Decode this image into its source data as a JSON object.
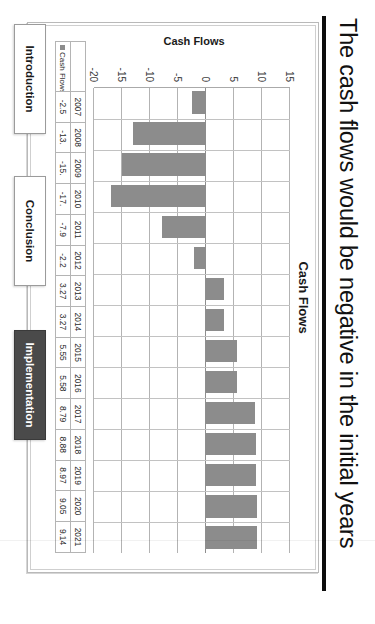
{
  "slide": {
    "title": "The cash flows would be negative in the initial years"
  },
  "chart_data": {
    "type": "bar",
    "title": "Cash Flows",
    "xlabel": "",
    "ylabel": "Cash Flows",
    "categories": [
      "2007",
      "2008",
      "2009",
      "2010",
      "2011",
      "2012",
      "2013",
      "2014",
      "2015",
      "2016",
      "2017",
      "2018",
      "2019",
      "2020",
      "2021"
    ],
    "values": [
      -2.5,
      -13.0,
      -15.0,
      -17.0,
      -7.9,
      -2.2,
      3.27,
      3.27,
      5.55,
      5.58,
      8.79,
      8.88,
      8.97,
      9.05,
      9.14
    ],
    "value_labels": [
      "-2.5",
      "-13.",
      "-15.",
      "-17.",
      "-7.9",
      "-2.2",
      "3.27",
      "3.27",
      "5.55",
      "5.58",
      "8.79",
      "8.88",
      "8.97",
      "9.05",
      "9.14"
    ],
    "ylim": [
      -20,
      15
    ],
    "yticks": [
      15,
      10,
      5,
      0,
      -5,
      -10,
      -15,
      -20
    ],
    "ytick_labels": [
      "15",
      "10",
      "5",
      "0",
      "-5",
      "-10",
      "-15",
      "-20"
    ],
    "grid": true,
    "legend": "Cash Flows",
    "legend_position": "data-table-row-header",
    "series_color": "#8c8c8c"
  },
  "table": {
    "legend_label": "Cash Flows",
    "blank_header": ""
  },
  "nav": {
    "introduction": "Introduction",
    "conclusion": "Conclusion",
    "implementation": "Implementation",
    "active": "Implementation"
  }
}
